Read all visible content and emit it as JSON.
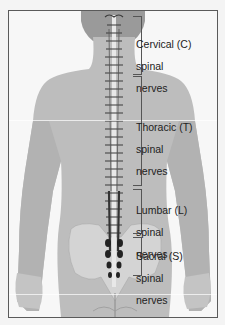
{
  "diagram": {
    "colors": {
      "skin": "#bdbdbd",
      "skin_light": "#cfcfcf",
      "background": "#f7f7f7",
      "spine": "#3a3a3a",
      "pelvis": "#d6d6d6",
      "border": "#5a5a5a"
    },
    "regions": [
      {
        "id": "cervical",
        "line1": "Cervical (C)",
        "line2": "spinal",
        "line3": "nerves"
      },
      {
        "id": "thoracic",
        "line1": "Thoracic (T)",
        "line2": "spinal",
        "line3": "nerves"
      },
      {
        "id": "lumbar",
        "line1": "Lumbar (L)",
        "line2": "spinal",
        "line3": "nerves"
      },
      {
        "id": "sacral",
        "line1": "Sacral (S)",
        "line2": "spinal",
        "line3": "nerves"
      }
    ]
  }
}
